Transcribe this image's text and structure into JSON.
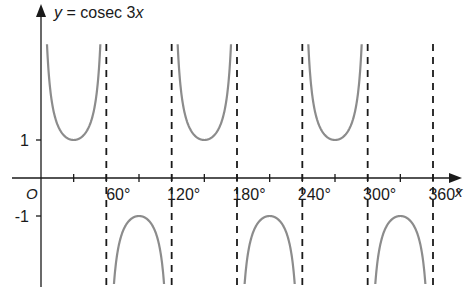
{
  "chart_data": {
    "type": "line",
    "title": "y = cosec 3x",
    "function": "cosec(3x)",
    "xlabel": "x",
    "ylabel": "y",
    "x_origin_label": "O",
    "x_ticks": [
      30,
      60,
      90,
      120,
      150,
      180,
      210,
      240,
      270,
      300,
      330,
      360
    ],
    "x_tick_labels": [
      "60°",
      "120°",
      "180°",
      "240°",
      "300°",
      "360°"
    ],
    "x_tick_label_values": [
      60,
      120,
      180,
      240,
      300,
      360
    ],
    "y_tick_labels": [
      "1",
      "-1"
    ],
    "y_tick_values": [
      1,
      -1
    ],
    "asymptotes": [
      60,
      120,
      180,
      240,
      300,
      360
    ],
    "xlim": [
      0,
      360
    ],
    "turning_points": [
      {
        "x": 30,
        "y": 1,
        "type": "min"
      },
      {
        "x": 90,
        "y": -1,
        "type": "max"
      },
      {
        "x": 150,
        "y": 1,
        "type": "min"
      },
      {
        "x": 210,
        "y": -1,
        "type": "max"
      },
      {
        "x": 270,
        "y": 1,
        "type": "min"
      },
      {
        "x": 330,
        "y": -1,
        "type": "max"
      }
    ],
    "grid": false,
    "legend": false,
    "colors": {
      "curve": "#8c8c8c",
      "axes": "#1a1a1a",
      "asymptote": "#1a1a1a"
    }
  }
}
